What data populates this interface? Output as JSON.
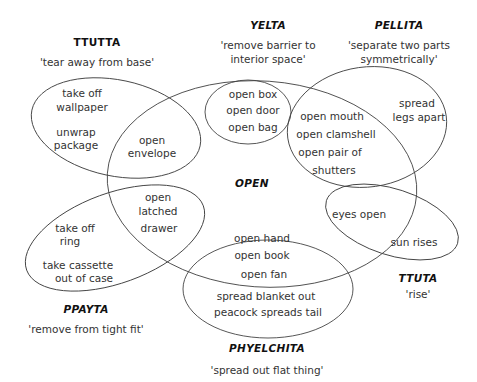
{
  "diagram": {
    "type": "venn-semantic-map",
    "central_concept": "OPEN",
    "line_color": "#444444",
    "categories": [
      {
        "id": "ttutta",
        "name": "TTUTTA",
        "gloss": "'tear away from base'",
        "items": [
          "take off wallpaper",
          "unwrap package"
        ]
      },
      {
        "id": "yelta",
        "name": "YELTA",
        "gloss_line1": "'remove barrier to",
        "gloss_line2": "interior space'",
        "items": [
          "open box",
          "open door",
          "open bag"
        ]
      },
      {
        "id": "pellita",
        "name": "PELLITA",
        "gloss_line1": "'separate two parts",
        "gloss_line2": "symmetrically'",
        "items": [
          "open mouth",
          "open clamshell",
          "open pair of shutters",
          "spread legs apart"
        ]
      },
      {
        "id": "ppayta",
        "name": "PPAYTA",
        "gloss": "'remove from tight fit'",
        "items": [
          "take off ring",
          "take cassette out of case",
          "open latched drawer"
        ]
      },
      {
        "id": "ttuta",
        "name": "TTUTA",
        "gloss": "'rise'",
        "items": [
          "eyes open",
          "sun rises"
        ]
      },
      {
        "id": "phyelchita",
        "name": "PHYELCHITA",
        "gloss": "'spread out flat thing'",
        "items": [
          "open hand",
          "open book",
          "open fan",
          "spread blanket out",
          "peacock spreads tail"
        ]
      }
    ],
    "labels": {
      "open": "OPEN",
      "ttutta_name": "TTUTTA",
      "ttutta_gloss": "'tear away from base'",
      "yelta_name": "YELTA",
      "yelta_gloss1": "'remove barrier to",
      "yelta_gloss2": "interior space'",
      "pellita_name": "PELLITA",
      "pellita_gloss1": "'separate two parts",
      "pellita_gloss2": "symmetrically'",
      "ppayta_name": "PPAYTA",
      "ppayta_gloss": "'remove from tight fit'",
      "ttuta_name": "TTUTA",
      "ttuta_gloss": "'rise'",
      "phyelchita_name": "PHYELCHITA",
      "phyelchita_gloss": "'spread out flat thing'"
    },
    "items": {
      "take_off_1": "take off",
      "wallpaper": "wallpaper",
      "unwrap": "unwrap",
      "package": "package",
      "open_env_1": "open",
      "envelope": "envelope",
      "open_box": "open box",
      "open_door": "open door",
      "open_bag": "open bag",
      "open_mouth": "open mouth",
      "open_clamshell": "open clamshell",
      "open_pair_of": "open pair of",
      "shutters": "shutters",
      "spread": "spread",
      "legs_apart": "legs apart",
      "open_latch_1": "open",
      "latched": "latched",
      "drawer": "drawer",
      "take_off_2": "take off",
      "ring": "ring",
      "take_cassette": "take cassette",
      "out_of_case": "out of case",
      "eyes_open": "eyes open",
      "sun_rises": "sun rises",
      "open_hand": "open hand",
      "open_book": "open book",
      "open_fan": "open fan",
      "spread_blanket_out": "spread blanket out",
      "peacock_spreads_tail": "peacock spreads tail"
    }
  }
}
